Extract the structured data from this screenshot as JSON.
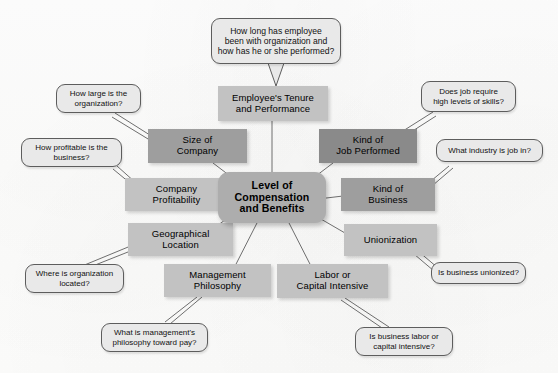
{
  "diagram": {
    "type": "mind-map",
    "center": {
      "id": "center",
      "label": "Level of\nCompensation\nand Benefits",
      "line1": "Level of",
      "line2": "Compensation",
      "line3": "and Benefits",
      "fill": "#adadad",
      "shape": "rounded-rectangle"
    },
    "factors": [
      {
        "id": "employee-tenure",
        "line1": "Employee's Tenure",
        "line2": "and Performance",
        "fill": "#c2c2c2",
        "position": "top-center"
      },
      {
        "id": "size-of-company",
        "line1": "Size of",
        "line2": "Company",
        "fill": "#9e9e9e",
        "position": "upper-left"
      },
      {
        "id": "kind-of-job-performed",
        "line1": "Kind of",
        "line2": "Job Performed",
        "fill": "#8a8a8a",
        "position": "upper-right"
      },
      {
        "id": "company-profitability",
        "line1": "Company",
        "line2": "Profitability",
        "fill": "#c2c2c2",
        "position": "left"
      },
      {
        "id": "kind-of-business",
        "line1": "Kind of",
        "line2": "Business",
        "fill": "#9e9e9e",
        "position": "right"
      },
      {
        "id": "geographical-location",
        "line1": "Geographical",
        "line2": "Location",
        "fill": "#c2c2c2",
        "position": "lower-left"
      },
      {
        "id": "unionization",
        "line1": "Unionization",
        "line2": "",
        "fill": "#c2c2c2",
        "position": "lower-right"
      },
      {
        "id": "management-philosophy",
        "line1": "Management",
        "line2": "Philosophy",
        "fill": "#c2c2c2",
        "position": "bottom-left"
      },
      {
        "id": "labor-or-capital-intensive",
        "line1": "Labor or",
        "line2": "Capital Intensive",
        "fill": "#c2c2c2",
        "position": "bottom-right"
      }
    ],
    "callouts": [
      {
        "id": "tenure-question",
        "line1": "How long has employee",
        "line2": "been with organization and",
        "line3": "how has he or she performed?",
        "points_to": "employee-tenure",
        "position": "top-center"
      },
      {
        "id": "size-question",
        "line1": "How large is the",
        "line2": "organization?",
        "points_to": "size-of-company",
        "position": "upper-left"
      },
      {
        "id": "skills-question",
        "line1": "Does job require",
        "line2": "high levels of skills?",
        "points_to": "kind-of-job-performed",
        "position": "upper-right"
      },
      {
        "id": "profitability-question",
        "line1": "How profitable is the",
        "line2": "business?",
        "points_to": "company-profitability",
        "position": "left"
      },
      {
        "id": "industry-question",
        "line1": "What industry is job in?",
        "line2": "",
        "points_to": "kind-of-business",
        "position": "right"
      },
      {
        "id": "location-question",
        "line1": "Where is organization",
        "line2": "located?",
        "points_to": "geographical-location",
        "position": "lower-left"
      },
      {
        "id": "unionized-question",
        "line1": "Is business unionized?",
        "line2": "",
        "points_to": "unionization",
        "position": "lower-right"
      },
      {
        "id": "philosophy-question",
        "line1": "What is management's",
        "line2": "philosophy toward pay?",
        "points_to": "management-philosophy",
        "position": "bottom-left"
      },
      {
        "id": "intensive-question",
        "line1": "Is business labor or",
        "line2": "capital intensive?",
        "points_to": "labor-or-capital-intensive",
        "position": "bottom-right"
      }
    ]
  }
}
